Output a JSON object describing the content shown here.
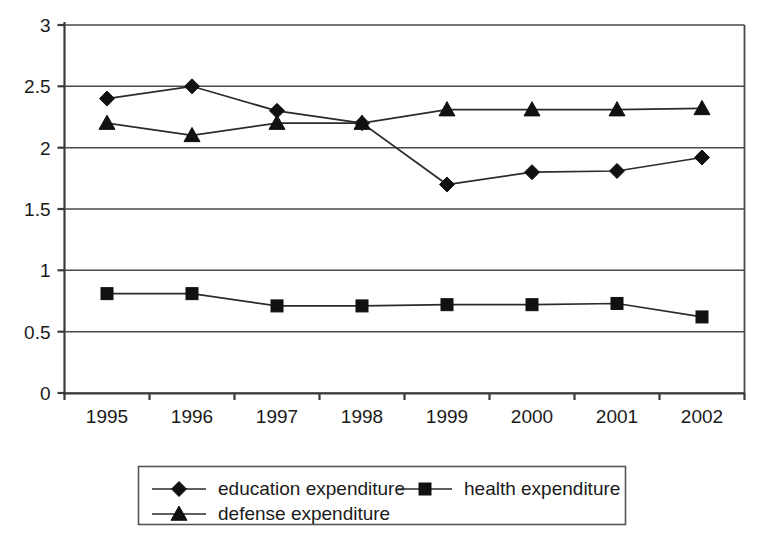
{
  "chart_data": {
    "type": "line",
    "title": "",
    "subtitle": "",
    "xlabel": "",
    "ylabel": "",
    "categories": [
      "1995",
      "1996",
      "1997",
      "1998",
      "1999",
      "2000",
      "2001",
      "2002"
    ],
    "ylim": [
      0,
      3
    ],
    "yticks": [
      "0",
      "0.5",
      "1",
      "1.5",
      "2",
      "2.5",
      "3"
    ],
    "ytick_values": [
      0,
      0.5,
      1,
      1.5,
      2,
      2.5,
      3
    ],
    "grid": true,
    "legend_position": "bottom",
    "series": [
      {
        "name": "education expenditure",
        "marker": "diamond",
        "values": [
          2.4,
          2.5,
          2.3,
          2.2,
          1.7,
          1.8,
          1.81,
          1.92
        ]
      },
      {
        "name": "health expenditure",
        "marker": "square",
        "values": [
          0.81,
          0.81,
          0.71,
          0.71,
          0.72,
          0.72,
          0.73,
          0.62
        ]
      },
      {
        "name": "defense expenditure",
        "marker": "triangle",
        "values": [
          2.2,
          2.1,
          2.2,
          2.2,
          2.31,
          2.31,
          2.31,
          2.32
        ]
      }
    ]
  },
  "colors": {
    "series_stroke": "#2b2b2b",
    "marker_fill": "#111111",
    "grid": "#4a4a4a",
    "axis": "#3a3a3a",
    "background": "#ffffff"
  }
}
